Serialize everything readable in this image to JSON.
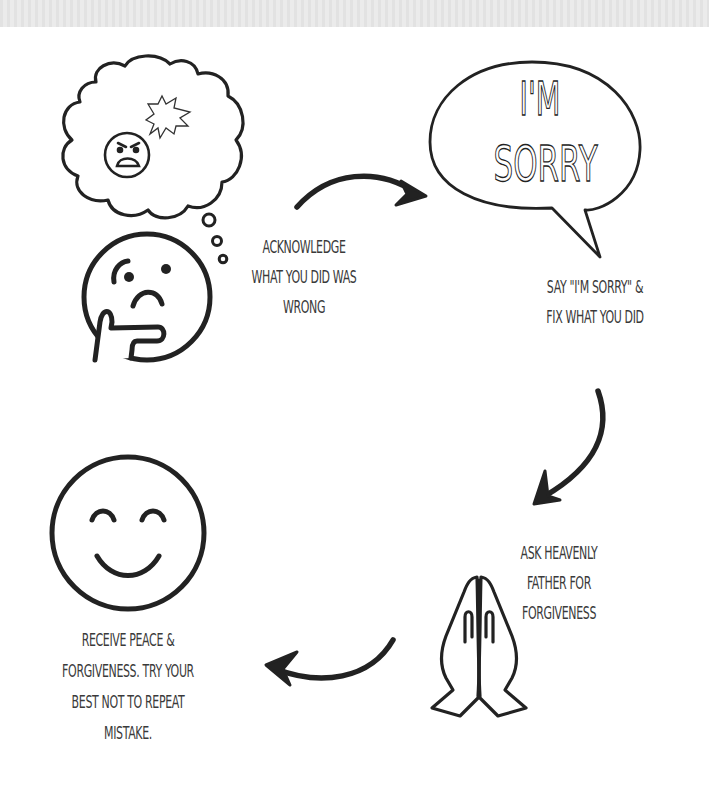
{
  "diagram": {
    "speech_bubble": {
      "line1": "I'M",
      "line2": "SORRY"
    },
    "steps": [
      {
        "id": 1,
        "icon": "thinking-face-icon",
        "lines": [
          "ACKNOWLEDGE",
          "WHAT YOU DID WAS",
          "WRONG"
        ]
      },
      {
        "id": 2,
        "icon": "speech-bubble-icon",
        "lines": [
          "SAY \"I'M SORRY\" &",
          "FIX WHAT YOU DID"
        ]
      },
      {
        "id": 3,
        "icon": "praying-hands-icon",
        "lines": [
          "ASK HEAVENLY",
          "FATHER FOR",
          "FORGIVENESS"
        ]
      },
      {
        "id": 4,
        "icon": "smiling-face-icon",
        "lines": [
          "RECEIVE PEACE &",
          "FORGIVENESS. TRY YOUR",
          "BEST NOT TO REPEAT",
          "MISTAKE."
        ]
      }
    ],
    "thought_cloud_icon": "angry-face-thought-cloud-icon",
    "arrows": [
      "arrow-right-icon",
      "arrow-down-icon",
      "arrow-left-icon"
    ],
    "colors": {
      "ink": "#222222",
      "text": "#3a3a3a",
      "background": "#ffffff",
      "top_band": "#e6e6e6"
    }
  }
}
